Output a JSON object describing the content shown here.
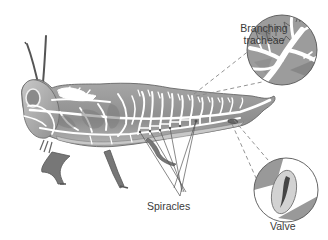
{
  "figure": {
    "labels": {
      "tracheae_line1": "Branching",
      "tracheae_line2": "tracheae",
      "spiracles": "Spiracles",
      "valve": "Valve"
    },
    "insets": [
      {
        "name": "branching-tracheae-inset",
        "shape": "circle",
        "cx": 282,
        "cy": 50,
        "r": 36
      },
      {
        "name": "valve-inset",
        "shape": "circle",
        "cx": 286,
        "cy": 190,
        "r": 33
      }
    ],
    "colors": {
      "body_fill": "#9a9a9a",
      "body_dark": "#7d7d7d",
      "body_light": "#c4c4c4",
      "tracheae": "#ffffff",
      "outline": "#555555",
      "label_text": "#3a3a3a",
      "leader_line": "#555555",
      "dashed_line": "#888888",
      "background": "#ffffff"
    }
  }
}
